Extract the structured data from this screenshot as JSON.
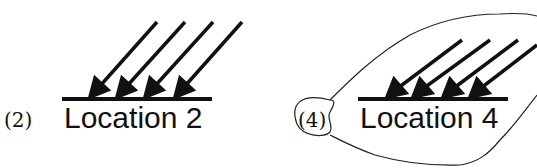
{
  "panels": [
    {
      "number_label": "(2)",
      "location_label": "Location 2",
      "arrow_count": 4,
      "circled": false
    },
    {
      "number_label": "(4)",
      "location_label": "Location 4",
      "arrow_count": 4,
      "circled": true
    }
  ],
  "colors": {
    "ink": "#111111",
    "background": "#ffffff"
  }
}
